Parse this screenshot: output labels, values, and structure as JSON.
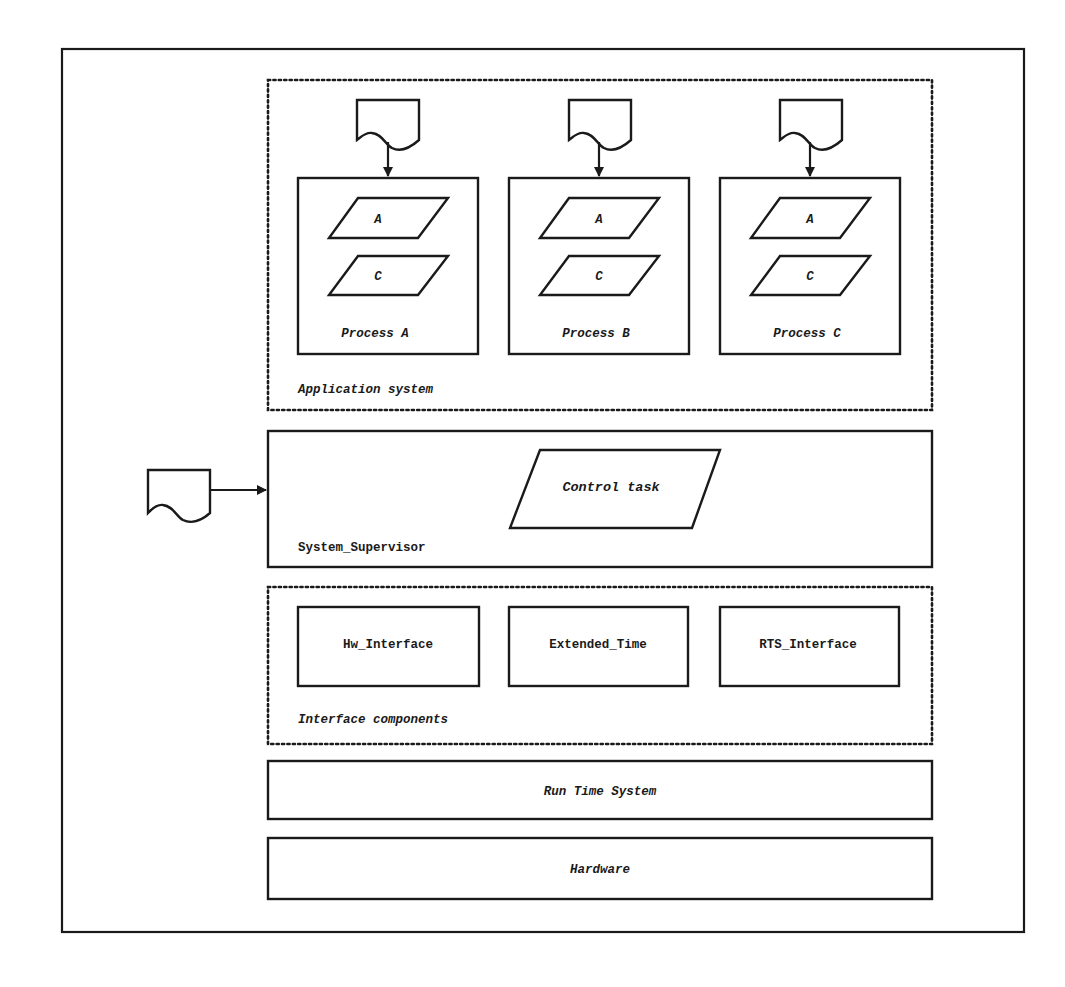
{
  "diagram": {
    "application_system": {
      "label": "Application system",
      "processes": [
        {
          "name": "Process A",
          "items": [
            "A",
            "C"
          ]
        },
        {
          "name": "Process B",
          "items": [
            "A",
            "C"
          ]
        },
        {
          "name": "Process C",
          "items": [
            "A",
            "C"
          ]
        }
      ]
    },
    "system_supervisor": {
      "label": "System_Supervisor",
      "task": "Control task"
    },
    "interface_components": {
      "label": "Interface components",
      "components": [
        "Hw_Interface",
        "Extended_Time",
        "RTS_Interface"
      ]
    },
    "run_time_system": {
      "label": "Run Time System"
    },
    "hardware": {
      "label": "Hardware"
    },
    "colors": {
      "ink": "#1a1a1a",
      "paper": "#ffffff"
    }
  }
}
